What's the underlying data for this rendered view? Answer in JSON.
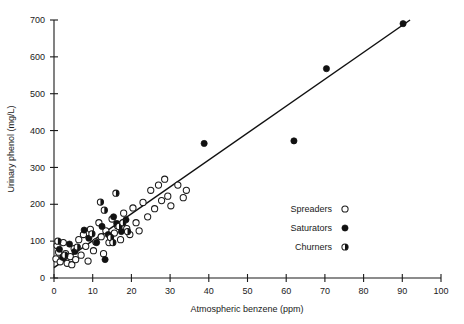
{
  "chart_data": {
    "type": "scatter",
    "title": "",
    "xlabel": "Atmospheric benzene (ppm)",
    "ylabel": "Urinary phenol (mg/L)",
    "xlim": [
      0,
      100
    ],
    "ylim": [
      0,
      700
    ],
    "xticks": [
      0,
      10,
      20,
      30,
      40,
      50,
      60,
      70,
      80,
      90,
      100
    ],
    "yticks": [
      0,
      100,
      200,
      300,
      400,
      500,
      600,
      700
    ],
    "grid": false,
    "legend_position": "center-right",
    "series": [
      {
        "name": "Spreaders",
        "marker": "open-circle",
        "color": "#ffffff",
        "edge_color": "#1a1a1a",
        "points": [
          [
            0.5,
            52
          ],
          [
            0.8,
            88
          ],
          [
            1.2,
            70
          ],
          [
            1.6,
            44
          ],
          [
            2.4,
            96
          ],
          [
            3.0,
            66
          ],
          [
            3.4,
            40
          ],
          [
            4.2,
            58
          ],
          [
            4.6,
            36
          ],
          [
            5.2,
            80
          ],
          [
            5.6,
            50
          ],
          [
            6.4,
            104
          ],
          [
            7.0,
            62
          ],
          [
            7.6,
            118
          ],
          [
            8.2,
            86
          ],
          [
            8.8,
            46
          ],
          [
            9.4,
            132
          ],
          [
            10.2,
            74
          ],
          [
            10.8,
            98
          ],
          [
            11.6,
            150
          ],
          [
            12.2,
            112
          ],
          [
            12.8,
            66
          ],
          [
            13.4,
            128
          ],
          [
            14.2,
            96
          ],
          [
            15.0,
            160
          ],
          [
            15.6,
            122
          ],
          [
            16.4,
            142
          ],
          [
            17.2,
            104
          ],
          [
            18.0,
            176
          ],
          [
            18.8,
            134
          ],
          [
            19.6,
            118
          ],
          [
            20.4,
            190
          ],
          [
            21.2,
            150
          ],
          [
            22.0,
            128
          ],
          [
            23.0,
            205
          ],
          [
            24.2,
            166
          ],
          [
            25.0,
            238
          ],
          [
            26.0,
            188
          ],
          [
            27.0,
            252
          ],
          [
            27.8,
            210
          ],
          [
            28.6,
            268
          ],
          [
            29.4,
            222
          ],
          [
            30.2,
            196
          ],
          [
            32.0,
            252
          ],
          [
            33.4,
            218
          ],
          [
            34.2,
            238
          ]
        ]
      },
      {
        "name": "Saturators",
        "marker": "filled-circle",
        "color": "#111111",
        "edge_color": "#111111",
        "points": [
          [
            1.4,
            78
          ],
          [
            2.2,
            56
          ],
          [
            4.0,
            92
          ],
          [
            5.4,
            72
          ],
          [
            7.8,
            130
          ],
          [
            9.0,
            108
          ],
          [
            11.0,
            96
          ],
          [
            12.4,
            140
          ],
          [
            13.2,
            50
          ],
          [
            14.0,
            118
          ],
          [
            15.4,
            166
          ],
          [
            16.2,
            148
          ],
          [
            17.4,
            126
          ],
          [
            18.6,
            158
          ],
          [
            38.8,
            365
          ],
          [
            62.0,
            372
          ],
          [
            70.4,
            568
          ],
          [
            90.2,
            690
          ]
        ]
      },
      {
        "name": "Churners",
        "marker": "half-filled-circle",
        "color": "#111111",
        "edge_color": "#1a1a1a",
        "points": [
          [
            1.0,
            100
          ],
          [
            2.8,
            62
          ],
          [
            6.0,
            84
          ],
          [
            9.8,
            120
          ],
          [
            12.0,
            206
          ],
          [
            13.0,
            184
          ],
          [
            14.6,
            110
          ],
          [
            15.2,
            96
          ],
          [
            16.0,
            230
          ],
          [
            16.8,
            140
          ],
          [
            17.8,
            150
          ],
          [
            19.0,
            126
          ]
        ]
      }
    ],
    "fit_line": {
      "label": "regression-line",
      "x_start": 0,
      "y_start": 28,
      "x_end": 92,
      "y_end": 700,
      "color": "#111111"
    }
  },
  "legend": {
    "entries": [
      {
        "label": "Spreaders",
        "marker": "open-circle"
      },
      {
        "label": "Saturators",
        "marker": "filled-circle"
      },
      {
        "label": "Churners",
        "marker": "half-filled-circle"
      }
    ]
  }
}
